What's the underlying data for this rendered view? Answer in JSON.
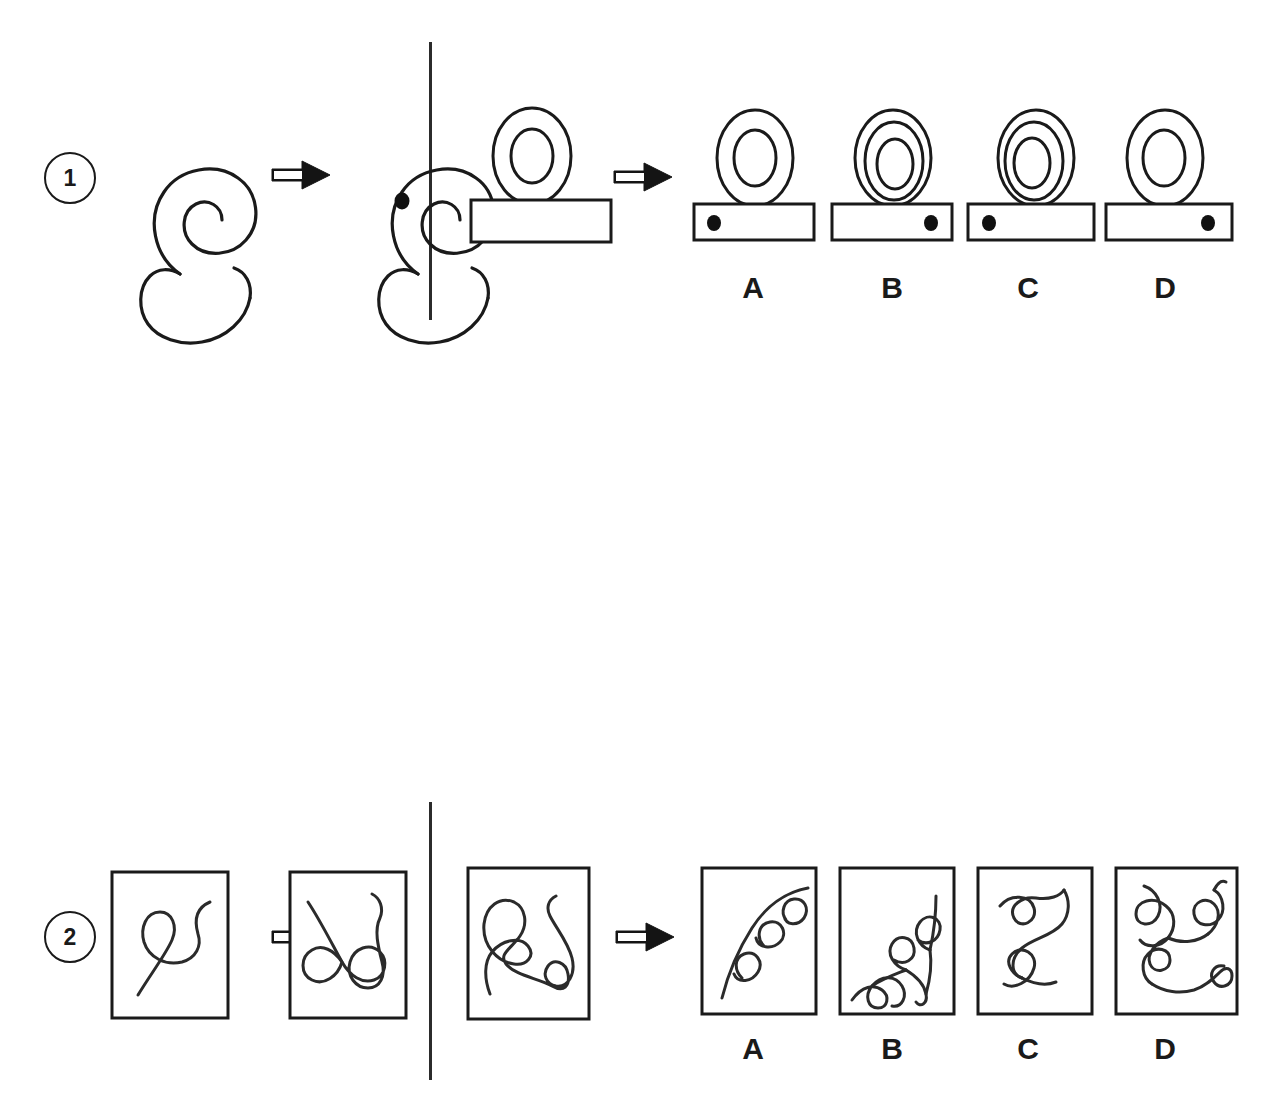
{
  "page": {
    "background_color": "#ffffff",
    "ink_color": "#1a1a1a",
    "gray_fill": "#4d4d4d",
    "black_fill": "#111111"
  },
  "option_letters": [
    "A",
    "B",
    "C",
    "D"
  ],
  "rows": [
    {
      "number": "1",
      "example": {
        "source_name": "spiral-shell-outline",
        "target_name": "spiral-shell-outline-with-black-dot",
        "arrow_name": "transform-arrow"
      },
      "question": {
        "source_name": "oval-on-bar-two-ovals-no-dot",
        "arrow_name": "transform-arrow",
        "description": "Oval with inner oval resting on an empty horizontal bar"
      },
      "options": [
        {
          "letter": "A",
          "name": "option-a-two-ovals-dot-left",
          "oval_rings": 2,
          "dot_side": "left"
        },
        {
          "letter": "B",
          "name": "option-b-three-ovals-dot-right",
          "oval_rings": 3,
          "dot_side": "right"
        },
        {
          "letter": "C",
          "name": "option-c-three-ovals-dot-left",
          "oval_rings": 3,
          "dot_side": "left"
        },
        {
          "letter": "D",
          "name": "option-d-two-ovals-dot-right",
          "oval_rings": 2,
          "dot_side": "right"
        }
      ]
    },
    {
      "number": "2",
      "example": {
        "source_name": "framed-squiggle-simple",
        "target_name": "framed-squiggle-with-extra-loops",
        "arrow_name": "transform-arrow"
      },
      "question": {
        "source_name": "framed-squiggle-two-loops",
        "arrow_name": "transform-arrow",
        "description": "Framed curve with a large loop at left and a small loop at upper right"
      },
      "options": [
        {
          "letter": "A",
          "name": "option-a-framed-curve-three-small-loops"
        },
        {
          "letter": "B",
          "name": "option-b-framed-curve-four-loops"
        },
        {
          "letter": "C",
          "name": "option-c-framed-curve-two-loops"
        },
        {
          "letter": "D",
          "name": "option-d-framed-curve-many-loops"
        }
      ]
    },
    {
      "number": "3",
      "example": {
        "source_name": "black-triangle-over-white-rectangle",
        "target_name": "black-pentagon-with-white-rectangle-notch",
        "arrow_name": "transform-arrow"
      },
      "question": {
        "source_name": "pentagon-outline-with-black-hexagon",
        "arrow_name": "transform-arrow",
        "description": "Heptagon outline overlapped at upper left by a solid black hexagon"
      },
      "options": [
        {
          "letter": "A",
          "name": "option-a-black-trapezoid-white-rectangle-black-triangle"
        },
        {
          "letter": "B",
          "name": "option-b-gray-octagon-white-pentagon-notch"
        },
        {
          "letter": "C",
          "name": "option-c-black-hexagon-over-white-rectangle"
        },
        {
          "letter": "D",
          "name": "option-d-octagon-outline-with-gray-hexagon"
        }
      ]
    }
  ]
}
